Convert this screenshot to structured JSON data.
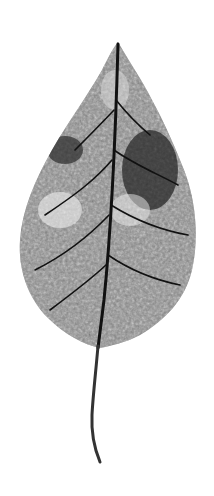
{
  "image": {
    "subject": "skeletonized leaf",
    "style": "grayscale",
    "background_color": "#ffffff",
    "leaf_color": "#2a2a2a",
    "vein_color": "#111111"
  }
}
